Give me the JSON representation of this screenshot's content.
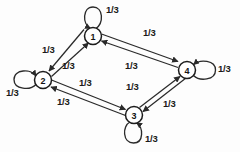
{
  "diagram": {
    "type": "directed-graph",
    "node_ids": [
      "1",
      "2",
      "3",
      "4"
    ],
    "nodes": [
      {
        "id": "1",
        "label": "1",
        "x": 93,
        "y": 36
      },
      {
        "id": "2",
        "label": "2",
        "x": 43,
        "y": 80
      },
      {
        "id": "3",
        "label": "3",
        "x": 134,
        "y": 115
      },
      {
        "id": "4",
        "label": "4",
        "x": 187,
        "y": 70
      }
    ],
    "self_loops": [
      {
        "node": "1",
        "label": "1/3",
        "label_x": 106,
        "label_y": 5,
        "position": "top"
      },
      {
        "node": "2",
        "label": "1/3",
        "label_x": 6,
        "label_y": 88,
        "position": "left"
      },
      {
        "node": "3",
        "label": "1/3",
        "label_x": 145,
        "label_y": 134,
        "position": "bottom"
      },
      {
        "node": "4",
        "label": "1/3",
        "label_x": 218,
        "label_y": 64,
        "position": "right"
      }
    ],
    "edges": [
      {
        "from": "1",
        "to": "2",
        "label": "1/3",
        "label_x": 42,
        "label_y": 45
      },
      {
        "from": "2",
        "to": "1",
        "label": "1/3",
        "label_x": 62,
        "label_y": 61
      },
      {
        "from": "1",
        "to": "4",
        "label": "1/3",
        "label_x": 143,
        "label_y": 28
      },
      {
        "from": "4",
        "to": "1",
        "label": "1/3",
        "label_x": 125,
        "label_y": 61
      },
      {
        "from": "2",
        "to": "3",
        "label": "1/3",
        "label_x": 79,
        "label_y": 78
      },
      {
        "from": "3",
        "to": "2",
        "label": "1/3",
        "label_x": 57,
        "label_y": 97
      },
      {
        "from": "3",
        "to": "4",
        "label": "1/3",
        "label_x": 126,
        "label_y": 82
      },
      {
        "from": "4",
        "to": "3",
        "label": "1/3",
        "label_x": 163,
        "label_y": 99
      }
    ],
    "colors": {
      "stroke": "#2a2a2a",
      "node_fill": "#ffffff",
      "text": "#1a1a1a",
      "background": "#fdfdfd"
    }
  }
}
